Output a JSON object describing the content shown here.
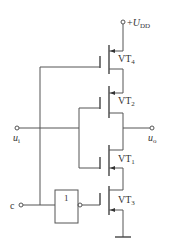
{
  "diagram": {
    "type": "CMOS transmission gate with enable (tri-state inverter style)",
    "supply_label_prefix": "+",
    "supply_label_main": "U",
    "supply_label_sub": "DD",
    "input_label_main": "u",
    "input_label_sub": "i",
    "output_label_main": "u",
    "output_label_sub": "o",
    "control_label": "c",
    "inverter_label": "1",
    "transistors": [
      {
        "name": "VT4",
        "main": "VT",
        "sub": "4"
      },
      {
        "name": "VT2",
        "main": "VT",
        "sub": "2"
      },
      {
        "name": "VT1",
        "main": "VT",
        "sub": "1"
      },
      {
        "name": "VT3",
        "main": "VT",
        "sub": "3"
      }
    ]
  }
}
